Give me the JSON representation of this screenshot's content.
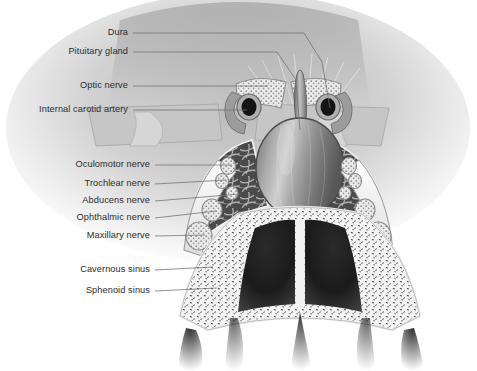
{
  "figure": {
    "style": "grayscale medical illustration",
    "width": 477,
    "height": 371,
    "background": "#ffffff",
    "ink": "#2b2b2b",
    "leader_color": "#6d6d6d"
  },
  "labels": [
    {
      "id": "dura",
      "text": "Dura",
      "tx": 128,
      "ty": 33,
      "lx": 133,
      "ly": 33,
      "path": "M133,33 L304,33 L322,62 L330,108"
    },
    {
      "id": "pituitary-gland",
      "text": "Pituitary gland",
      "tx": 128,
      "ty": 52,
      "lx": 133,
      "ly": 52,
      "path": "M133,52 L277,52 L296,80 L300,130"
    },
    {
      "id": "optic-nerve",
      "text": "Optic nerve",
      "tx": 128,
      "ty": 86,
      "lx": 133,
      "ly": 86,
      "path": "M133,86 L268,86"
    },
    {
      "id": "internal-carotid-artery",
      "text": "Internal carotid artery",
      "tx": 128,
      "ty": 110,
      "lx": 133,
      "ly": 110,
      "path": "M133,110 L247,110"
    },
    {
      "id": "oculomotor-nerve",
      "text": "Oculomotor nerve",
      "tx": 150,
      "ty": 165,
      "lx": 155,
      "ly": 165,
      "path": "M155,165 L232,165"
    },
    {
      "id": "trochlear-nerve",
      "text": "Trochlear nerve",
      "tx": 150,
      "ty": 184,
      "lx": 155,
      "ly": 184,
      "path": "M155,184 L226,180"
    },
    {
      "id": "abducens-nerve",
      "text": "Abducens nerve",
      "tx": 150,
      "ty": 201,
      "lx": 155,
      "ly": 201,
      "path": "M155,201 L240,194"
    },
    {
      "id": "ophthalmic-nerve",
      "text": "Ophthalmic nerve",
      "tx": 150,
      "ty": 218,
      "lx": 155,
      "ly": 218,
      "path": "M155,218 L216,211"
    },
    {
      "id": "maxillary-nerve",
      "text": "Maxillary nerve",
      "tx": 150,
      "ty": 236,
      "lx": 155,
      "ly": 236,
      "path": "M155,236 L205,235"
    },
    {
      "id": "cavernous-sinus",
      "text": "Cavernous sinus",
      "tx": 150,
      "ty": 270,
      "lx": 155,
      "ly": 270,
      "path": "M155,270 L213,267"
    },
    {
      "id": "sphenoid-sinus",
      "text": "Sphenoid sinus",
      "tx": 150,
      "ty": 291,
      "lx": 155,
      "ly": 291,
      "path": "M155,291 L217,288"
    }
  ],
  "structures": {
    "pituitary_gland": "ovoid gland with vertical striations in sella turcica",
    "pituitary_stalk": "infundibulum rising superiorly from gland",
    "optic_nerves": "paired stippled bands superolateral to stalk",
    "carotid_arteries": "paired dark ring lumens lateral to gland",
    "cranial_nerves": "stippled oval cross-sections in lateral dural wall",
    "cavernous_sinus": "trabeculated venous meshwork flanking pituitary",
    "sphenoid_sinus": "paired dark air cavities with central septum",
    "cancellous_bone": "speckled trabecular bone of sphenoid body"
  }
}
